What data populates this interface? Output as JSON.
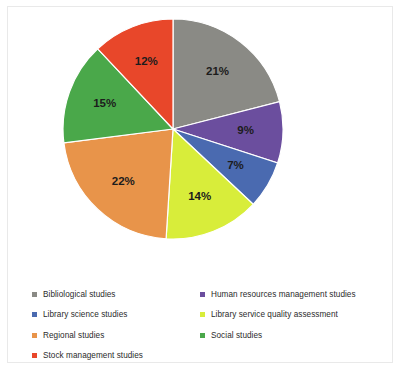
{
  "chart_data": {
    "type": "pie",
    "title": "",
    "categories": [
      "Bibliological studies",
      "Human resources management studies",
      "Library science studies",
      "Library service quality assessment",
      "Regional studies",
      "Social studies",
      "Stock management studies"
    ],
    "slices": [
      {
        "label": "Bibliological studies",
        "value": 21,
        "display": "21%",
        "color": "#8a8a85"
      },
      {
        "label": "Human resources management studies",
        "value": 9,
        "display": "9%",
        "color": "#6b4e9e"
      },
      {
        "label": "Library science studies",
        "value": 7,
        "display": "7%",
        "color": "#4a6ab0"
      },
      {
        "label": "Library service quality assessment",
        "value": 14,
        "display": "14%",
        "color": "#d8ed3a"
      },
      {
        "label": "Regional studies",
        "value": 22,
        "display": "22%",
        "color": "#e8944a"
      },
      {
        "label": "Social studies",
        "value": 15,
        "display": "15%",
        "color": "#4aa84a"
      },
      {
        "label": "Stock management studies",
        "value": 12,
        "display": "12%",
        "color": "#e8472a"
      }
    ],
    "values": [
      21,
      9,
      7,
      14,
      22,
      15,
      12
    ],
    "labels_shown": [
      "21%",
      "9%",
      "7%",
      "14%",
      "22%",
      "15%",
      "12%"
    ],
    "start_angle_deg": 0,
    "direction": "clockwise",
    "legend_position": "bottom",
    "legend_columns": 2,
    "grid": false,
    "xlabel": "",
    "ylabel": ""
  },
  "legend": {
    "left_column": [
      {
        "label": "Bibliological studies",
        "color": "#8a8a85"
      },
      {
        "label": "Library science studies",
        "color": "#4a6ab0"
      },
      {
        "label": "Regional studies",
        "color": "#e8944a"
      },
      {
        "label": "Stock management studies",
        "color": "#e8472a"
      }
    ],
    "right_column": [
      {
        "label": "Human resources management studies",
        "color": "#6b4e9e"
      },
      {
        "label": "Library service quality assessment",
        "color": "#d8ed3a"
      },
      {
        "label": "Social studies",
        "color": "#4aa84a"
      }
    ]
  }
}
